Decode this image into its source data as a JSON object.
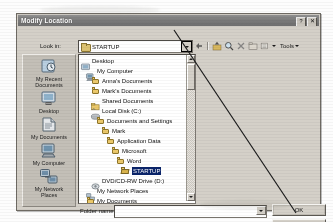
{
  "window": {
    "title": "Modify Location",
    "help_button": "?",
    "close_button": "✕"
  },
  "lookin": {
    "label": "Look in:",
    "value": "STARTUP",
    "folder_icon": "folder-icon",
    "dropdown_icon": "chevron-down-icon",
    "highlighted": true
  },
  "toolbar": {
    "items": [
      {
        "name": "back-button",
        "icon": "back-arrow-icon"
      },
      {
        "name": "up-one-level-button",
        "icon": "up-folder-icon"
      },
      {
        "name": "search-web-button",
        "icon": "search-icon"
      },
      {
        "name": "delete-button",
        "icon": "delete-x-icon"
      },
      {
        "name": "new-folder-button",
        "icon": "new-folder-icon"
      },
      {
        "name": "views-button",
        "icon": "views-list-icon"
      }
    ],
    "tools_label": "Tools",
    "tools_caret": "chevron-down-icon"
  },
  "places": [
    {
      "label": "My Recent\nDocuments",
      "icon": "recent-documents-icon"
    },
    {
      "label": "Desktop",
      "icon": "desktop-icon"
    },
    {
      "label": "My Documents",
      "icon": "my-documents-icon"
    },
    {
      "label": "My Computer",
      "icon": "my-computer-icon"
    },
    {
      "label": "My Network\nPlaces",
      "icon": "network-places-icon"
    }
  ],
  "tree": {
    "items": [
      {
        "label": "Desktop",
        "indent": 0,
        "icon": "desktop-small-icon",
        "selected": false
      },
      {
        "label": "My Computer",
        "indent": 1,
        "icon": "computer-small-icon",
        "selected": false
      },
      {
        "label": "Anna's Documents",
        "indent": 2,
        "icon": "folder-icon",
        "selected": false
      },
      {
        "label": "Mark's Documents",
        "indent": 2,
        "icon": "folder-icon",
        "selected": false
      },
      {
        "label": "Shared Documents",
        "indent": 2,
        "icon": "shared-folder-icon",
        "selected": false
      },
      {
        "label": "Local Disk (C:)",
        "indent": 2,
        "icon": "hard-drive-icon",
        "selected": false
      },
      {
        "label": "Documents and Settings",
        "indent": 3,
        "icon": "folder-icon",
        "selected": false
      },
      {
        "label": "Mark",
        "indent": 4,
        "icon": "folder-icon",
        "selected": false
      },
      {
        "label": "Application Data",
        "indent": 5,
        "icon": "folder-icon",
        "selected": false
      },
      {
        "label": "Microsoft",
        "indent": 6,
        "icon": "folder-icon",
        "selected": false
      },
      {
        "label": "Word",
        "indent": 7,
        "icon": "folder-icon",
        "selected": false
      },
      {
        "label": "STARTUP",
        "indent": 8,
        "icon": "folder-open-icon",
        "selected": true
      },
      {
        "label": "DVD/CD-RW Drive (D:)",
        "indent": 2,
        "icon": "optical-drive-icon",
        "selected": false
      },
      {
        "label": "My Network Places",
        "indent": 1,
        "icon": "network-places-icon",
        "selected": false
      },
      {
        "label": "My Documents",
        "indent": 1,
        "icon": "folder-icon",
        "selected": false
      },
      {
        "label": "FTP Locations",
        "indent": 0,
        "icon": "folder-icon",
        "selected": false
      },
      {
        "label": "Add/Modify FTP Locations",
        "indent": 1,
        "icon": "ftp-icon",
        "selected": false
      }
    ]
  },
  "scrollbar": {
    "up_icon": "scroll-up-arrow-icon",
    "down_icon": "scroll-down-arrow-icon"
  },
  "folder_name": {
    "label": "Folder name:",
    "value": "",
    "dropdown_icon": "chevron-down-icon"
  },
  "buttons": {
    "ok": "OK",
    "cancel": "Cancel"
  },
  "annotation": {
    "type": "callout-line",
    "points": "from dropdown arrow to lower right"
  },
  "colors": {
    "dialog_face": "#d4d0c8",
    "titlebar": "#7b7b7b",
    "selection": "#0a246a",
    "folder_yellow": "#ecc96b",
    "field_bg": "#ffffff"
  }
}
